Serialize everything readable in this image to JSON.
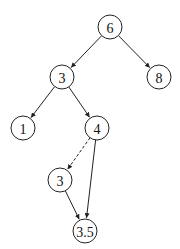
{
  "diagram": {
    "type": "binary-search-tree",
    "nodes": [
      {
        "id": "n6",
        "label": "6",
        "x": 110,
        "y": 27
      },
      {
        "id": "n3",
        "label": "3",
        "x": 62,
        "y": 77
      },
      {
        "id": "n8",
        "label": "8",
        "x": 159,
        "y": 77
      },
      {
        "id": "n1",
        "label": "1",
        "x": 23,
        "y": 128
      },
      {
        "id": "n4",
        "label": "4",
        "x": 97,
        "y": 128
      },
      {
        "id": "n3b",
        "label": "3",
        "x": 60,
        "y": 180
      },
      {
        "id": "n35",
        "label": "3.5",
        "x": 85,
        "y": 231
      }
    ],
    "edges": [
      {
        "from": "n6",
        "to": "n3",
        "style": "solid"
      },
      {
        "from": "n6",
        "to": "n8",
        "style": "solid"
      },
      {
        "from": "n3",
        "to": "n1",
        "style": "solid"
      },
      {
        "from": "n3",
        "to": "n4",
        "style": "solid"
      },
      {
        "from": "n4",
        "to": "n3b",
        "style": "dashed"
      },
      {
        "from": "n4",
        "to": "n35",
        "style": "solid"
      },
      {
        "from": "n3b",
        "to": "n35",
        "style": "solid"
      }
    ],
    "node_radius": 12
  }
}
